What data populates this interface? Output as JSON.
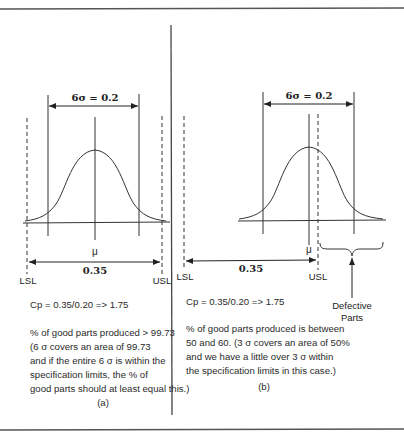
{
  "figure": {
    "panels": [
      {
        "id": "a",
        "sigma_label": "6σ = 0.2",
        "mean_label": "μ",
        "spec_width_label": "0.35",
        "lsl_label": "LSL",
        "usl_label": "USL",
        "cp_formula": "Cp = 0.35/0.20 => 1.75",
        "description_lines": [
          "% of good parts produced > 99.73",
          "(6 σ covers an area of 99.73",
          "and if the entire 6 σ is within the",
          "specification limits, the % of",
          "good parts should at least equal this.)"
        ],
        "caption": "(a)"
      },
      {
        "id": "b",
        "sigma_label": "6σ = 0.2",
        "mean_label": "μ",
        "spec_width_label": "0.35",
        "lsl_label": "LSL",
        "usl_label": "USL",
        "defective_label_lines": [
          "Defective",
          "Parts"
        ],
        "cp_formula": "Cp = 0.35/0.20 => 1.75",
        "description_lines": [
          "% of good parts produced is between",
          "50 and 60. (3 σ covers an area of 50%",
          "and we have a little over 3 σ within",
          "the specification limits in this case.)"
        ],
        "caption": "(b)"
      }
    ]
  },
  "colors": {
    "line": "#333333",
    "rule": "#555555",
    "text": "#2a2a2a"
  }
}
